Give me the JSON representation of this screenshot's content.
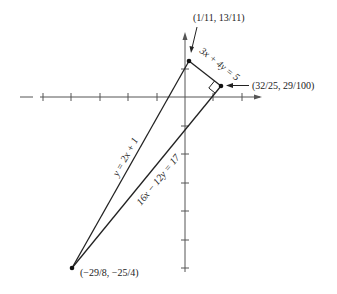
{
  "diagram": {
    "type": "coordinate-geometry",
    "axes": {
      "x_ticks": [
        -5,
        -4,
        -3,
        -2,
        -1,
        1,
        2
      ],
      "y_ticks": [
        1,
        -1,
        -2,
        -3,
        -4,
        -5,
        -6
      ]
    },
    "points": {
      "top": "(1/11, 13/11)",
      "right": "(32/25, 29/100)",
      "bottom": "(−29/8, −25/4)"
    },
    "lines": {
      "short": "3x + 4y = 5",
      "left": "y = 2x + 1",
      "long": "16x − 12y = 17"
    }
  }
}
